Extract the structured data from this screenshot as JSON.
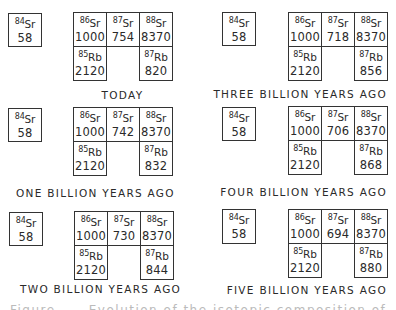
{
  "figure": {
    "panels": [
      {
        "label": "TODAY",
        "sr84": {
          "mass": "84",
          "symbol": "Sr",
          "value": "58"
        },
        "sr86": {
          "mass": "86",
          "symbol": "Sr",
          "value": "1000"
        },
        "sr87": {
          "mass": "87",
          "symbol": "Sr",
          "value": "754"
        },
        "sr88": {
          "mass": "88",
          "symbol": "Sr",
          "value": "8370"
        },
        "rb85": {
          "mass": "85",
          "symbol": "Rb",
          "value": "2120"
        },
        "rb87": {
          "mass": "87",
          "symbol": "Rb",
          "value": "820"
        }
      },
      {
        "label": "THREE BILLION YEARS AGO",
        "sr84": {
          "mass": "84",
          "symbol": "Sr",
          "value": "58"
        },
        "sr86": {
          "mass": "86",
          "symbol": "Sr",
          "value": "1000"
        },
        "sr87": {
          "mass": "87",
          "symbol": "Sr",
          "value": "718"
        },
        "sr88": {
          "mass": "88",
          "symbol": "Sr",
          "value": "8370"
        },
        "rb85": {
          "mass": "85",
          "symbol": "Rb",
          "value": "2120"
        },
        "rb87": {
          "mass": "87",
          "symbol": "Rb",
          "value": "856"
        }
      },
      {
        "label": "ONE BILLION YEARS AGO",
        "sr84": {
          "mass": "84",
          "symbol": "Sr",
          "value": "58"
        },
        "sr86": {
          "mass": "86",
          "symbol": "Sr",
          "value": "1000"
        },
        "sr87": {
          "mass": "87",
          "symbol": "Sr",
          "value": "742"
        },
        "sr88": {
          "mass": "88",
          "symbol": "Sr",
          "value": "8370"
        },
        "rb85": {
          "mass": "85",
          "symbol": "Rb",
          "value": "2120"
        },
        "rb87": {
          "mass": "87",
          "symbol": "Rb",
          "value": "832"
        }
      },
      {
        "label": "FOUR BILLION YEARS AGO",
        "sr84": {
          "mass": "84",
          "symbol": "Sr",
          "value": "58"
        },
        "sr86": {
          "mass": "86",
          "symbol": "Sr",
          "value": "1000"
        },
        "sr87": {
          "mass": "87",
          "symbol": "Sr",
          "value": "706"
        },
        "sr88": {
          "mass": "88",
          "symbol": "Sr",
          "value": "8370"
        },
        "rb85": {
          "mass": "85",
          "symbol": "Rb",
          "value": "2120"
        },
        "rb87": {
          "mass": "87",
          "symbol": "Rb",
          "value": "868"
        }
      },
      {
        "label": "TWO BILLION YEARS AGO",
        "sr84": {
          "mass": "84",
          "symbol": "Sr",
          "value": "58"
        },
        "sr86": {
          "mass": "86",
          "symbol": "Sr",
          "value": "1000"
        },
        "sr87": {
          "mass": "87",
          "symbol": "Sr",
          "value": "730"
        },
        "sr88": {
          "mass": "88",
          "symbol": "Sr",
          "value": "8370"
        },
        "rb85": {
          "mass": "85",
          "symbol": "Rb",
          "value": "2120"
        },
        "rb87": {
          "mass": "87",
          "symbol": "Rb",
          "value": "844"
        }
      },
      {
        "label": "FIVE BILLION YEARS AGO",
        "sr84": {
          "mass": "84",
          "symbol": "Sr",
          "value": "58"
        },
        "sr86": {
          "mass": "86",
          "symbol": "Sr",
          "value": "1000"
        },
        "sr87": {
          "mass": "87",
          "symbol": "Sr",
          "value": "694"
        },
        "sr88": {
          "mass": "88",
          "symbol": "Sr",
          "value": "8370"
        },
        "rb85": {
          "mass": "85",
          "symbol": "Rb",
          "value": "2120"
        },
        "rb87": {
          "mass": "87",
          "symbol": "Rb",
          "value": "880"
        }
      }
    ],
    "caption": "Figure ___ Evolution of the isotopic composition of ___"
  }
}
